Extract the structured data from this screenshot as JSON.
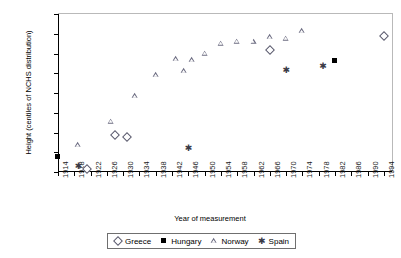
{
  "chart_data": {
    "type": "scatter",
    "title": "",
    "xlabel": "Year of measurement",
    "ylabel": "Height (centiles of NCHS distribution)",
    "xlim": [
      1914,
      1996
    ],
    "ylim": [
      0,
      80
    ],
    "ytick_labels": [
      "0.00",
      "10.00",
      "20.00",
      "30.00",
      "40.00",
      "50.00",
      "60.00",
      "70.00",
      "80.00"
    ],
    "ytick_values": [
      0,
      10,
      20,
      30,
      40,
      50,
      60,
      70,
      80
    ],
    "xtick_labels": [
      "1914",
      "1918",
      "1922",
      "1926",
      "1930",
      "1934",
      "1938",
      "1942",
      "1946",
      "1950",
      "1954",
      "1958",
      "1962",
      "1966",
      "1970",
      "1974",
      "1978",
      "1982",
      "1986",
      "1990",
      "1994"
    ],
    "xtick_values": [
      1914,
      1918,
      1922,
      1926,
      1930,
      1934,
      1938,
      1942,
      1946,
      1950,
      1954,
      1958,
      1962,
      1966,
      1970,
      1974,
      1978,
      1982,
      1986,
      1990,
      1994
    ],
    "grid": false,
    "legend_position": "bottom",
    "series": [
      {
        "name": "Greece",
        "marker": "diamond",
        "color": "#5b5b6e",
        "points": [
          {
            "x": 1921,
            "y": 1.5
          },
          {
            "x": 1928,
            "y": 18.5
          },
          {
            "x": 1931,
            "y": 17.5
          },
          {
            "x": 1966,
            "y": 62.0
          },
          {
            "x": 1994,
            "y": 69.0
          }
        ]
      },
      {
        "name": "Hungary",
        "marker": "filled-square",
        "color": "#000000",
        "points": [
          {
            "x": 1914,
            "y": 7.5
          },
          {
            "x": 1982,
            "y": 56.0
          }
        ]
      },
      {
        "name": "Norway",
        "marker": "triangle",
        "color": "#6b6b80",
        "points": [
          {
            "x": 1919,
            "y": 13.5
          },
          {
            "x": 1927,
            "y": 25.5
          },
          {
            "x": 1933,
            "y": 38.5
          },
          {
            "x": 1938,
            "y": 49.0
          },
          {
            "x": 1943,
            "y": 57.0
          },
          {
            "x": 1945,
            "y": 51.0
          },
          {
            "x": 1947,
            "y": 56.5
          },
          {
            "x": 1950,
            "y": 60.0
          },
          {
            "x": 1954,
            "y": 65.0
          },
          {
            "x": 1958,
            "y": 66.0
          },
          {
            "x": 1962,
            "y": 66.0
          },
          {
            "x": 1966,
            "y": 68.5
          },
          {
            "x": 1970,
            "y": 67.5
          },
          {
            "x": 1974,
            "y": 71.5
          }
        ]
      },
      {
        "name": "Spain",
        "marker": "star",
        "color": "#3a3a46",
        "points": [
          {
            "x": 1919,
            "y": 3.0
          },
          {
            "x": 1946,
            "y": 12.0
          },
          {
            "x": 1970,
            "y": 51.5
          },
          {
            "x": 1979,
            "y": 53.5
          }
        ]
      }
    ]
  },
  "legend": {
    "entries": [
      {
        "label": "Greece",
        "marker": "diamond"
      },
      {
        "label": "Hungary",
        "marker": "filled-square"
      },
      {
        "label": "Norway",
        "marker": "triangle"
      },
      {
        "label": "Spain",
        "marker": "star"
      }
    ]
  },
  "caption": ""
}
